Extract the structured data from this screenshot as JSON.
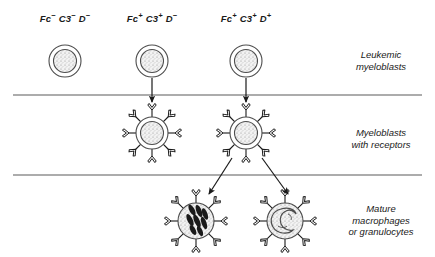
{
  "figure": {
    "type": "biological-schematic",
    "width": 435,
    "height": 257,
    "background": "#ffffff",
    "line_color": "#4d4d4d",
    "ink_color": "#1a1a1a"
  },
  "columns": [
    {
      "id": "col-fc-neg",
      "label_html": "Fc<sup>−</sup> C3<sup>−</sup> D<sup>−</sup>",
      "label_text": "Fc− C3− D−",
      "x": 65
    },
    {
      "id": "col-fc-pos-d-neg",
      "label_html": "Fc<sup>+</sup> C3<sup>+</sup> D<sup>−</sup>",
      "label_text": "Fc+ C3+ D−",
      "x": 152
    },
    {
      "id": "col-fc-pos-d-pos",
      "label_html": "Fc<sup>+</sup> C3<sup>+</sup> D<sup>+</sup>",
      "label_text": "Fc+ C3+ D+",
      "x": 246
    }
  ],
  "rows": [
    {
      "id": "row-leukemic",
      "line1": "Leukemic",
      "line2": "myeloblasts",
      "line3": "",
      "x": 381,
      "y": 60
    },
    {
      "id": "row-receptors",
      "line1": "Myeloblasts",
      "line2": "with receptors",
      "line3": "",
      "x": 381,
      "y": 138
    },
    {
      "id": "row-mature",
      "line1": "Mature",
      "line2": "macrophages",
      "line3": "or granulocytes",
      "x": 381,
      "y": 220
    }
  ],
  "dividers": [
    {
      "id": "divider-upper",
      "y": 95,
      "x1": 13,
      "x2": 422
    },
    {
      "id": "divider-lower",
      "y": 175,
      "x1": 13,
      "x2": 422
    }
  ],
  "cells": [
    {
      "id": "cell-blast-1",
      "kind": "leukemic-myeloblast",
      "cx": 65,
      "cy": 61,
      "r_outer": 16,
      "r_inner": 11,
      "nucleus": "stippled-round",
      "receptors": 0
    },
    {
      "id": "cell-blast-2",
      "kind": "leukemic-myeloblast",
      "cx": 152,
      "cy": 61,
      "r_outer": 16,
      "r_inner": 11,
      "nucleus": "stippled-round",
      "receptors": 0
    },
    {
      "id": "cell-blast-3",
      "kind": "leukemic-myeloblast",
      "cx": 246,
      "cy": 61,
      "r_outer": 16,
      "r_inner": 11,
      "nucleus": "stippled-round",
      "receptors": 0
    },
    {
      "id": "cell-receptor-1",
      "kind": "myeloblast-with-receptors",
      "cx": 152,
      "cy": 133,
      "r_outer": 16,
      "r_inner": 11,
      "nucleus": "stippled-round",
      "receptors": 8
    },
    {
      "id": "cell-receptor-2",
      "kind": "myeloblast-with-receptors",
      "cx": 246,
      "cy": 133,
      "r_outer": 16,
      "r_inner": 11,
      "nucleus": "stippled-round",
      "receptors": 8
    },
    {
      "id": "cell-granulocyte",
      "kind": "mature-granulocyte",
      "cx": 196,
      "cy": 221,
      "r_outer": 18,
      "r_inner": 18,
      "nucleus": "multi-lobed-dark",
      "receptors": 8
    },
    {
      "id": "cell-macrophage",
      "kind": "mature-macrophage",
      "cx": 285,
      "cy": 221,
      "r_outer": 18,
      "r_inner": 18,
      "nucleus": "kidney-shaped",
      "receptors": 8
    }
  ],
  "arrows": [
    {
      "id": "arrow-down-col2",
      "kind": "vertical",
      "x1": 152,
      "y1": 78,
      "x2": 152,
      "y2": 102
    },
    {
      "id": "arrow-down-col3",
      "kind": "vertical",
      "x1": 246,
      "y1": 78,
      "x2": 246,
      "y2": 102
    },
    {
      "id": "arrow-branch-left",
      "kind": "diagonal",
      "x1": 232,
      "y1": 158,
      "x2": 209,
      "y2": 194
    },
    {
      "id": "arrow-branch-right",
      "kind": "diagonal",
      "x1": 262,
      "y1": 158,
      "x2": 288,
      "y2": 194
    }
  ]
}
